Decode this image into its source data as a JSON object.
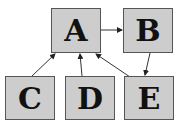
{
  "nodes": [
    {
      "id": "A",
      "label": "A",
      "x": 51,
      "y": 8,
      "w": 50,
      "h": 45
    },
    {
      "id": "B",
      "label": "B",
      "x": 123,
      "y": 8,
      "w": 50,
      "h": 45
    },
    {
      "id": "C",
      "label": "C",
      "x": 5,
      "y": 76,
      "w": 50,
      "h": 44
    },
    {
      "id": "D",
      "label": "D",
      "x": 65,
      "y": 76,
      "w": 50,
      "h": 44
    },
    {
      "id": "E",
      "label": "E",
      "x": 124,
      "y": 76,
      "w": 50,
      "h": 44
    }
  ],
  "edges": [
    {
      "from": "A",
      "to": "B",
      "x1": 101,
      "y1": 30,
      "x2": 122,
      "y2": 30
    },
    {
      "from": "B",
      "to": "E",
      "x1": 150,
      "y1": 53,
      "x2": 145,
      "y2": 75
    },
    {
      "from": "C",
      "to": "A",
      "x1": 32,
      "y1": 76,
      "x2": 55,
      "y2": 54
    },
    {
      "from": "D",
      "to": "A",
      "x1": 82,
      "y1": 76,
      "x2": 80,
      "y2": 54
    },
    {
      "from": "E",
      "to": "A",
      "x1": 130,
      "y1": 77,
      "x2": 96,
      "y2": 54
    }
  ],
  "colors": {
    "node_fill": "#cdcdcd",
    "node_border": "#555555",
    "edge": "#333333"
  }
}
